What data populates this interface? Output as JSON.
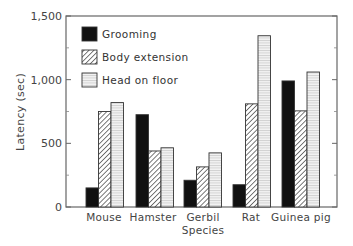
{
  "chart_data": {
    "type": "bar",
    "title": "",
    "xlabel": "Species",
    "ylabel": "Latency (sec)",
    "ylim": [
      0,
      1500
    ],
    "yticks": [
      0,
      500,
      1000,
      1500
    ],
    "ytick_labels": [
      "0",
      "500",
      "1,000",
      "1,500"
    ],
    "grid": false,
    "legend_position": "upper-left-inside",
    "categories": [
      "Mouse",
      "Hamster",
      "Gerbil",
      "Rat",
      "Guinea pig"
    ],
    "series": [
      {
        "name": "Grooming",
        "fill": "solid-black",
        "values": [
          150,
          725,
          210,
          175,
          990
        ]
      },
      {
        "name": "Body extension",
        "fill": "diagonal-hatch",
        "values": [
          750,
          440,
          315,
          810,
          755
        ]
      },
      {
        "name": "Head on floor",
        "fill": "horizontal-lines-light",
        "values": [
          820,
          465,
          425,
          1345,
          1060
        ]
      }
    ]
  },
  "colors": {
    "grooming": "#111111",
    "frame": "#555555",
    "text": "#444444"
  }
}
